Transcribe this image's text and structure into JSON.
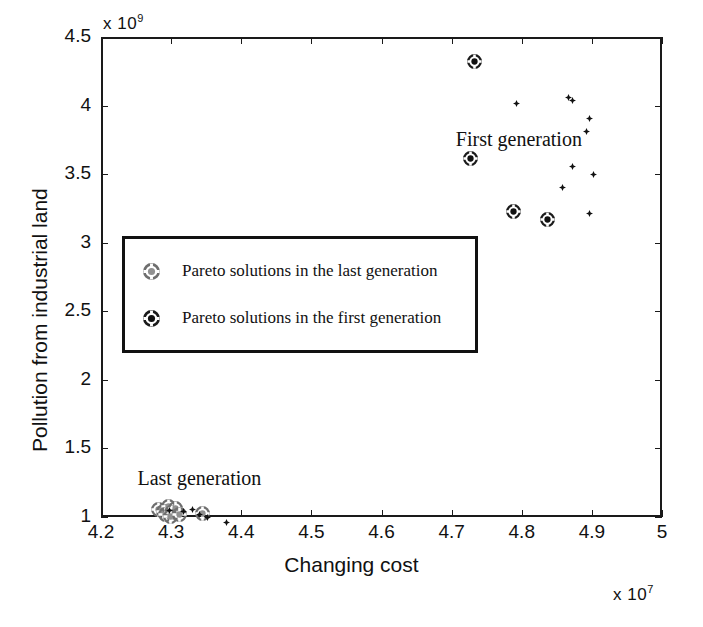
{
  "chart_data": {
    "type": "scatter",
    "title": "",
    "xlabel": "Changing cost",
    "ylabel": "Pollution from industrial land",
    "x_exponent": "x 10",
    "x_exponent_power": "7",
    "y_exponent": "x 10",
    "y_exponent_power": "9",
    "xlim": [
      4.2,
      5.0
    ],
    "ylim": [
      1.0,
      4.5
    ],
    "x_ticks": [
      "4.2",
      "4.3",
      "4.4",
      "4.5",
      "4.6",
      "4.7",
      "4.8",
      "4.9",
      "5"
    ],
    "x_tick_values": [
      4.2,
      4.3,
      4.4,
      4.5,
      4.6,
      4.7,
      4.8,
      4.9,
      5.0
    ],
    "y_ticks": [
      "4.5",
      "4",
      "3.5",
      "3",
      "2.5",
      "2",
      "1.5",
      "1"
    ],
    "y_tick_values": [
      4.5,
      4.0,
      3.5,
      3.0,
      2.5,
      2.0,
      1.5,
      1.0
    ],
    "grid": false,
    "legend_position": "center-left inside axes",
    "annotations": [
      {
        "text": "First generation",
        "x": 4.706,
        "y": 3.74
      },
      {
        "text": "Last generation",
        "x": 4.252,
        "y": 1.27
      }
    ],
    "series": [
      {
        "name": "Pareto solutions in the first generation",
        "marker": "circled-cross-dark",
        "points": [
          {
            "x": 4.733,
            "y": 4.325
          },
          {
            "x": 4.727,
            "y": 3.615
          },
          {
            "x": 4.788,
            "y": 3.225
          },
          {
            "x": 4.837,
            "y": 3.17
          }
        ]
      },
      {
        "name": "first-generation-spread",
        "marker": "diamond-small",
        "points": [
          {
            "x": 4.793,
            "y": 4.065
          },
          {
            "x": 4.873,
            "y": 4.09
          },
          {
            "x": 4.866,
            "y": 4.112
          },
          {
            "x": 4.897,
            "y": 3.96
          },
          {
            "x": 4.892,
            "y": 3.86
          },
          {
            "x": 4.872,
            "y": 3.61
          },
          {
            "x": 4.903,
            "y": 3.545
          },
          {
            "x": 4.858,
            "y": 3.455
          },
          {
            "x": 4.896,
            "y": 3.265
          }
        ]
      },
      {
        "name": "Pareto solutions in the last generation",
        "marker": "circled-cross-light",
        "points": [
          {
            "x": 4.282,
            "y": 1.055
          },
          {
            "x": 4.289,
            "y": 1.04
          },
          {
            "x": 4.296,
            "y": 1.075
          },
          {
            "x": 4.292,
            "y": 1.02
          },
          {
            "x": 4.301,
            "y": 1.03
          },
          {
            "x": 4.306,
            "y": 1.06
          },
          {
            "x": 4.299,
            "y": 1.005
          },
          {
            "x": 4.312,
            "y": 1.015
          },
          {
            "x": 4.345,
            "y": 1.022
          }
        ]
      },
      {
        "name": "last-generation-spread",
        "marker": "diamond-small",
        "points": [
          {
            "x": 4.297,
            "y": 1.098
          },
          {
            "x": 4.318,
            "y": 1.088
          },
          {
            "x": 4.33,
            "y": 1.108
          },
          {
            "x": 4.34,
            "y": 1.068
          },
          {
            "x": 4.352,
            "y": 1.045
          },
          {
            "x": 4.379,
            "y": 1.012
          }
        ]
      }
    ]
  },
  "legend": {
    "entries": [
      {
        "label": "Pareto solutions in the last generation",
        "marker": "circled-cross-light"
      },
      {
        "label": "Pareto solutions in the first generation",
        "marker": "circled-cross-dark"
      }
    ]
  }
}
